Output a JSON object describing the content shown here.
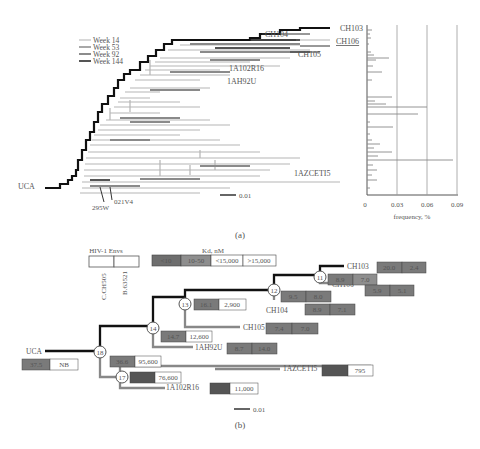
{
  "panel_a": {
    "caption": "(a)",
    "legend": [
      {
        "label": "Week 14",
        "color": "#d8d8d8"
      },
      {
        "label": "Week 53",
        "color": "#a8a8a8"
      },
      {
        "label": "Week 92",
        "color": "#8c8c8c"
      },
      {
        "label": "Week 144",
        "color": "#555555"
      }
    ],
    "tip_labels": {
      "ch103": "CH103",
      "ch104": "CH104",
      "ch106": "CH106",
      "ch105": "CH105",
      "r16": "1A102R16",
      "u92": "1AH92U",
      "azcet": "1AZCETI5",
      "uca": "UCA",
      "w295": "295W",
      "v021": "021V4"
    },
    "scale_bar": "0.01",
    "histogram": {
      "xlabel": "frequency, %",
      "ticks": [
        "0",
        "0.03",
        "0.06",
        "0.09"
      ]
    }
  },
  "panel_b": {
    "caption": "(b)",
    "envs_legend": {
      "title": "HIV-1  Envs",
      "columns": [
        "C.CH505",
        "B.63521"
      ]
    },
    "kd_legend": {
      "title": "Kd, nM",
      "bins": [
        {
          "label": "<10",
          "color": "#6e6e6e"
        },
        {
          "label": "10-50",
          "color": "#8e8e8e"
        },
        {
          "label": "<15,000",
          "color": "#ffffff"
        },
        {
          "label": ">15,000",
          "color": "#ffffff"
        }
      ]
    },
    "nodes": [
      "11",
      "12",
      "13",
      "14",
      "17",
      "18"
    ],
    "tips": {
      "ch103": {
        "label": "CH103",
        "kd": [
          "20.0",
          "2.4"
        ]
      },
      "ch106": {
        "label": "CH106",
        "kd": [
          "5.9",
          "5.1"
        ]
      },
      "ch104": {
        "label": "CH104",
        "kd": [
          "8.9",
          "7.1"
        ]
      },
      "ch105": {
        "label": "CH105",
        "kd": [
          "7.4",
          "7.0"
        ]
      },
      "u92": {
        "label": "1AH92U",
        "kd": [
          "8.7",
          "14.0"
        ]
      },
      "azcet": {
        "label": "1AZCETI5",
        "kd": [
          "9.0",
          "795"
        ]
      },
      "r16": {
        "label": "1A102R16",
        "kd": [
          "2.5",
          "11,000"
        ]
      },
      "uca": {
        "label": "UCA",
        "kd": [
          "37.5",
          "NB"
        ]
      }
    },
    "node_kd": {
      "n11": [
        "8.9",
        "7.0"
      ],
      "n12": [
        "9.5",
        "8.0"
      ],
      "n13": [
        "16.1",
        "2,900"
      ],
      "n14": [
        "14.7",
        "12,600"
      ],
      "n18": [
        "36.6",
        "95,600"
      ],
      "n17": [
        "5.1",
        "76,600"
      ]
    },
    "scale_bar": "0.01"
  }
}
